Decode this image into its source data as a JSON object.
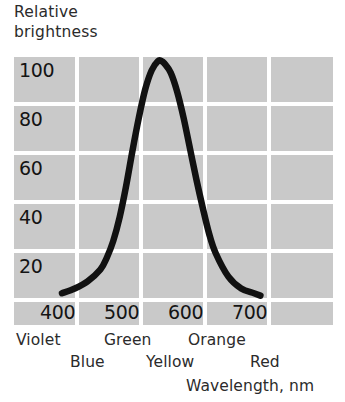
{
  "chart_data": {
    "type": "line",
    "title": "Relative brightness",
    "ylabel_line1": "Relative",
    "ylabel_line2": "brightness",
    "xlabel": "Wavelength, nm",
    "xlim": [
      370,
      740
    ],
    "ylim": [
      0,
      110
    ],
    "grid": true,
    "legend": "none",
    "yticks": [
      "100",
      "80",
      "60",
      "40",
      "20"
    ],
    "ytick_values": [
      100,
      80,
      60,
      40,
      20
    ],
    "xticks": [
      "400",
      "500",
      "600",
      "700"
    ],
    "xtick_values": [
      400,
      500,
      600,
      700
    ],
    "x": [
      400,
      420,
      440,
      460,
      470,
      480,
      490,
      500,
      510,
      520,
      530,
      540,
      550,
      555,
      560,
      570,
      580,
      590,
      600,
      610,
      620,
      630,
      640,
      660,
      680,
      700,
      710
    ],
    "values": [
      2,
      4,
      7,
      12,
      17,
      24,
      34,
      47,
      62,
      76,
      88,
      96,
      100,
      100,
      99,
      95,
      87,
      76,
      63,
      50,
      38,
      27,
      19,
      9,
      4,
      2,
      1
    ],
    "series": [
      {
        "name": "Relative brightness",
        "values": [
          2,
          4,
          7,
          12,
          17,
          24,
          34,
          47,
          62,
          76,
          88,
          96,
          100,
          100,
          99,
          95,
          87,
          76,
          63,
          50,
          38,
          27,
          19,
          9,
          4,
          2,
          1
        ]
      }
    ],
    "annotations": [
      {
        "label": "Violet",
        "row": 1
      },
      {
        "label": "Blue",
        "row": 2
      },
      {
        "label": "Green",
        "row": 1
      },
      {
        "label": "Yellow",
        "row": 2
      },
      {
        "label": "Orange",
        "row": 1
      },
      {
        "label": "Red",
        "row": 2
      }
    ],
    "colors": {
      "grid_block": "#c9c9c9",
      "curve": "#111111",
      "background": "#ffffff",
      "text": "#1a1a1a"
    }
  },
  "axes": {
    "y": {
      "title_line1": "Relative",
      "title_line2": "brightness",
      "ticks": [
        {
          "label": "100",
          "top": 4
        },
        {
          "label": "80",
          "top": 53
        },
        {
          "label": "60",
          "top": 102
        },
        {
          "label": "40",
          "top": 151
        },
        {
          "label": "20",
          "top": 200
        }
      ]
    },
    "x": {
      "title": "Wavelength, nm",
      "ticks": [
        {
          "label": "400",
          "left": 26
        },
        {
          "label": "500",
          "left": 90
        },
        {
          "label": "600",
          "left": 154
        },
        {
          "label": "700",
          "left": 218
        }
      ]
    }
  },
  "color_bands": {
    "row1": [
      {
        "label": "Violet",
        "left": 16
      },
      {
        "label": "Green",
        "left": 104
      },
      {
        "label": "Orange",
        "left": 188
      }
    ],
    "row2": [
      {
        "label": "Blue",
        "left": 70
      },
      {
        "label": "Yellow",
        "left": 146
      },
      {
        "label": "Red",
        "left": 250
      }
    ]
  }
}
